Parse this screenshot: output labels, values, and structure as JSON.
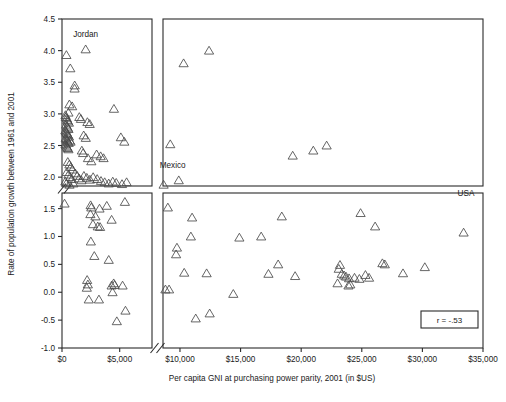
{
  "chart_data": {
    "type": "scatter",
    "title": "",
    "xlabel": "Per capita GNI at purchasing power parity, 2001 (in $US)",
    "ylabel": "Rate of population growth between 1961 and 2001",
    "marker": "open-triangle",
    "xlim": [
      0,
      35000
    ],
    "ylim": [
      -1.0,
      4.5
    ],
    "grid": false,
    "legend": null,
    "broken_axis": {
      "x_break": [
        7800,
        8600
      ],
      "y_break": [
        1.78,
        1.86
      ],
      "x_left_range": [
        0,
        7800
      ],
      "x_right_range": [
        8600,
        35000
      ],
      "y_bottom_range": [
        -1.0,
        1.78
      ],
      "y_top_range": [
        1.86,
        4.5
      ]
    },
    "xticks": [
      0,
      5000,
      10000,
      15000,
      20000,
      25000,
      30000,
      35000
    ],
    "xticklabels": [
      "$0",
      "$5,000",
      "$10,000",
      "$15,000",
      "$20,000",
      "$25,000",
      "$30,000",
      "$35,000"
    ],
    "yticks": [
      -1.0,
      -0.5,
      0.0,
      0.5,
      1.0,
      1.5,
      2.0,
      2.5,
      3.0,
      3.5,
      4.0,
      4.5
    ],
    "yticklabels": [
      "-1.0",
      "-0.5",
      "0.0",
      "0.5",
      "1.0",
      "1.5",
      "2.0",
      "2.5",
      "3.0",
      "3.5",
      "4.0",
      "4.5"
    ],
    "annotations": [
      {
        "text": "Jordan",
        "x": 2050,
        "y": 4.22
      },
      {
        "text": "Mexico",
        "x": 9400,
        "y": 2.14
      },
      {
        "text": "USA",
        "x": 33600,
        "y": 1.72
      },
      {
        "text": "r = -.53",
        "x": 31600,
        "y": -0.63
      }
    ],
    "stat_box": {
      "label": "r = -.53",
      "value": -0.53,
      "symbol": "r"
    },
    "points": [
      [
        380,
        3.93
      ],
      [
        720,
        3.72
      ],
      [
        1100,
        3.45
      ],
      [
        1090,
        3.4
      ],
      [
        2050,
        4.02
      ],
      [
        640,
        3.15
      ],
      [
        880,
        3.12
      ],
      [
        560,
        3.02
      ],
      [
        300,
        2.98
      ],
      [
        330,
        2.95
      ],
      [
        420,
        2.93
      ],
      [
        470,
        2.9
      ],
      [
        520,
        2.88
      ],
      [
        600,
        2.86
      ],
      [
        360,
        2.83
      ],
      [
        430,
        2.8
      ],
      [
        500,
        2.78
      ],
      [
        560,
        2.76
      ],
      [
        290,
        2.74
      ],
      [
        340,
        2.72
      ],
      [
        400,
        2.7
      ],
      [
        470,
        2.68
      ],
      [
        530,
        2.66
      ],
      [
        610,
        2.64
      ],
      [
        320,
        2.62
      ],
      [
        380,
        2.6
      ],
      [
        450,
        2.58
      ],
      [
        510,
        2.56
      ],
      [
        580,
        2.54
      ],
      [
        300,
        2.52
      ],
      [
        360,
        2.5
      ],
      [
        430,
        2.48
      ],
      [
        490,
        2.46
      ],
      [
        560,
        2.44
      ],
      [
        670,
        2.58
      ],
      [
        740,
        2.56
      ],
      [
        1500,
        2.95
      ],
      [
        1640,
        2.92
      ],
      [
        2200,
        2.87
      ],
      [
        2400,
        2.84
      ],
      [
        1880,
        2.66
      ],
      [
        2060,
        2.62
      ],
      [
        4500,
        3.08
      ],
      [
        5100,
        2.63
      ],
      [
        5400,
        2.56
      ],
      [
        1720,
        2.42
      ],
      [
        1830,
        2.38
      ],
      [
        2250,
        2.3
      ],
      [
        2540,
        2.25
      ],
      [
        3000,
        2.36
      ],
      [
        3350,
        2.33
      ],
      [
        3600,
        2.3
      ],
      [
        500,
        2.24
      ],
      [
        640,
        2.2
      ],
      [
        760,
        2.16
      ],
      [
        900,
        2.12
      ],
      [
        420,
        2.08
      ],
      [
        560,
        2.04
      ],
      [
        700,
        2.0
      ],
      [
        850,
        1.97
      ],
      [
        1150,
        2.06
      ],
      [
        1320,
        2.02
      ],
      [
        1480,
        1.98
      ],
      [
        1680,
        1.95
      ],
      [
        1900,
        2.02
      ],
      [
        2150,
        1.99
      ],
      [
        2420,
        1.96
      ],
      [
        2700,
        2.0
      ],
      [
        3050,
        1.97
      ],
      [
        3380,
        1.94
      ],
      [
        3700,
        1.92
      ],
      [
        4050,
        1.9
      ],
      [
        4400,
        1.93
      ],
      [
        4700,
        1.91
      ],
      [
        5200,
        1.89
      ],
      [
        5600,
        1.92
      ],
      [
        290,
        1.93
      ],
      [
        380,
        1.9
      ],
      [
        650,
        1.88
      ],
      [
        980,
        1.9
      ],
      [
        8650,
        1.88
      ],
      [
        9900,
        1.95
      ],
      [
        9200,
        2.52
      ],
      [
        10300,
        3.8
      ],
      [
        12400,
        4.0
      ],
      [
        19300,
        2.34
      ],
      [
        21000,
        2.42
      ],
      [
        22100,
        2.5
      ],
      [
        220,
        1.59
      ],
      [
        2480,
        1.56
      ],
      [
        2540,
        1.52
      ],
      [
        3250,
        1.5
      ],
      [
        3880,
        1.55
      ],
      [
        5450,
        1.62
      ],
      [
        2460,
        1.4
      ],
      [
        2900,
        1.36
      ],
      [
        4300,
        1.3
      ],
      [
        2680,
        1.22
      ],
      [
        3100,
        1.18
      ],
      [
        3300,
        1.17
      ],
      [
        2500,
        0.91
      ],
      [
        2800,
        0.65
      ],
      [
        4050,
        0.58
      ],
      [
        2180,
        0.22
      ],
      [
        2240,
        0.14
      ],
      [
        2150,
        0.08
      ],
      [
        4300,
        0.12
      ],
      [
        4480,
        0.16
      ],
      [
        4560,
        0.13
      ],
      [
        5250,
        0.12
      ],
      [
        2320,
        -0.13
      ],
      [
        3200,
        -0.13
      ],
      [
        4380,
        0.0
      ],
      [
        4750,
        -0.52
      ],
      [
        5500,
        -0.33
      ],
      [
        9000,
        1.52
      ],
      [
        11000,
        1.34
      ],
      [
        9750,
        0.8
      ],
      [
        9680,
        0.68
      ],
      [
        10900,
        1.0
      ],
      [
        14900,
        0.98
      ],
      [
        10350,
        0.35
      ],
      [
        12200,
        0.34
      ],
      [
        8800,
        0.05
      ],
      [
        9100,
        0.05
      ],
      [
        14400,
        -0.03
      ],
      [
        11300,
        -0.47
      ],
      [
        12450,
        -0.38
      ],
      [
        16700,
        1.0
      ],
      [
        18400,
        1.36
      ],
      [
        18100,
        0.5
      ],
      [
        17300,
        0.33
      ],
      [
        19500,
        0.29
      ],
      [
        23200,
        0.49
      ],
      [
        23100,
        0.42
      ],
      [
        23350,
        0.33
      ],
      [
        23550,
        0.3
      ],
      [
        23700,
        0.28
      ],
      [
        23950,
        0.25
      ],
      [
        24400,
        0.26
      ],
      [
        24800,
        0.24
      ],
      [
        25300,
        0.31
      ],
      [
        25600,
        0.26
      ],
      [
        23000,
        0.16
      ],
      [
        24050,
        0.14
      ],
      [
        23900,
        0.12
      ],
      [
        26700,
        0.52
      ],
      [
        26900,
        0.5
      ],
      [
        28400,
        0.34
      ],
      [
        30200,
        0.45
      ],
      [
        24900,
        1.42
      ],
      [
        26100,
        1.18
      ],
      [
        33400,
        1.07
      ]
    ]
  },
  "figure": {
    "ylabel_text": "Rate of population growth between 1961 and 2001",
    "xlabel_text": "Per capita GNI at purchasing power parity, 2001 (in $US)"
  }
}
